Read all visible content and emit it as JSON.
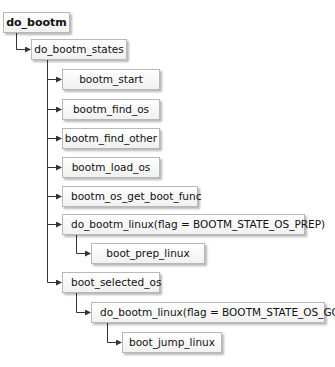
{
  "diagram": {
    "type": "call-tree",
    "nodes": [
      {
        "id": "n0",
        "label": "do_bootm",
        "level": 0
      },
      {
        "id": "n1",
        "label": "do_bootm_states",
        "level": 1
      },
      {
        "id": "n2",
        "label": "bootm_start",
        "level": 2
      },
      {
        "id": "n3",
        "label": "bootm_find_os",
        "level": 2
      },
      {
        "id": "n4",
        "label": "bootm_find_other",
        "level": 2
      },
      {
        "id": "n5",
        "label": "bootm_load_os",
        "level": 2
      },
      {
        "id": "n6",
        "label": "bootm_os_get_boot_func",
        "level": 2
      },
      {
        "id": "n7",
        "label": "do_bootm_linux(flag = BOOTM_STATE_OS_PREP)",
        "level": 2
      },
      {
        "id": "n8",
        "label": "boot_prep_linux",
        "level": 3
      },
      {
        "id": "n9",
        "label": "boot_selected_os",
        "level": 2
      },
      {
        "id": "n10",
        "label": "do_bootm_linux(flag = BOOTM_STATE_OS_GO)",
        "level": 3
      },
      {
        "id": "n11",
        "label": "boot_jump_linux",
        "level": 4
      }
    ],
    "edges": [
      [
        "n0",
        "n1"
      ],
      [
        "n1",
        "n2"
      ],
      [
        "n1",
        "n3"
      ],
      [
        "n1",
        "n4"
      ],
      [
        "n1",
        "n5"
      ],
      [
        "n1",
        "n6"
      ],
      [
        "n1",
        "n7"
      ],
      [
        "n7",
        "n8"
      ],
      [
        "n1",
        "n9"
      ],
      [
        "n9",
        "n10"
      ],
      [
        "n10",
        "n11"
      ]
    ]
  }
}
